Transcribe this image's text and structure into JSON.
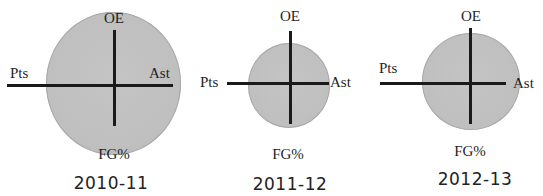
{
  "diagram": {
    "type": "radial-glyph-comparison",
    "axes": {
      "top": "OE",
      "left": "Pts",
      "right": "Ast",
      "bottom": "FG%"
    },
    "colors": {
      "circle_fill": "#c0c0c0",
      "circle_edge": "#a9a9a9",
      "axis_line": "#1a1a1a",
      "text": "#222222"
    },
    "panels": [
      {
        "season": "2010-11",
        "labels": {
          "top": "OE",
          "left": "Pts",
          "right": "Ast",
          "bottom": "FG%"
        },
        "relative_size": "large"
      },
      {
        "season": "2011-12",
        "labels": {
          "top": "OE",
          "left": "Pts",
          "right": "Ast",
          "bottom": "FG%"
        },
        "relative_size": "small"
      },
      {
        "season": "2012-13",
        "labels": {
          "top": "OE",
          "left": "Pts",
          "right": "Ast",
          "bottom": "FG%"
        },
        "relative_size": "medium"
      }
    ]
  }
}
